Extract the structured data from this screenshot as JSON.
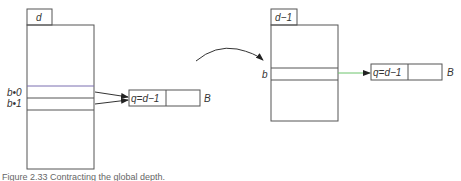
{
  "left_table": {
    "tab_label": "d",
    "row_labels": [
      "b•0",
      "b•1"
    ],
    "bucket": {
      "cell_label": "q=d−1",
      "name": "B"
    }
  },
  "right_table": {
    "tab_label": "d−1",
    "row_label": "b",
    "bucket": {
      "cell_label": "q=d−1",
      "name": "B"
    }
  },
  "caption": "Figure 2.33  Contracting the global depth.",
  "colors": {
    "line": "#555555",
    "arrow_green": "#6cc46c"
  }
}
